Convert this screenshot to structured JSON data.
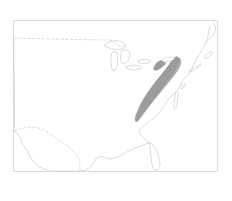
{
  "figure": {
    "kind": "distribution-range-map",
    "title": "",
    "caption": "",
    "region": "Eastern and central United States",
    "projection_note": "",
    "canvas": {
      "width": 232,
      "height": 201
    },
    "frame": {
      "x": 13.5,
      "y": 20.5,
      "width": 204,
      "height": 151,
      "stroke_color": "#d8d8d8",
      "visible": true
    }
  },
  "colors": {
    "background": "#ffffff",
    "frame_stroke": "#d8d8d8",
    "coastline_stroke": "#c9c9c9",
    "lake_stroke": "#c4c4c4",
    "political_border_stroke": "#cccccc",
    "range_fill": "#9c9c9c",
    "range_stroke": "#8f8f8f",
    "range_hole_fill": "#ffffff"
  },
  "legend": {
    "visible": false,
    "entries": []
  },
  "labels": {
    "visible": false,
    "items": []
  },
  "axes": {
    "visible": false,
    "tick_labels": []
  },
  "layers": [
    {
      "id": "national-outline",
      "name": "United States coastline and national outline",
      "style": "solid-thin-gray",
      "interactable": false
    },
    {
      "id": "great-lakes",
      "name": "Great Lakes outlines",
      "style": "solid-thin-gray",
      "interactable": false
    },
    {
      "id": "northern-border",
      "name": "United States - Canada border (49th parallel)",
      "style": "dashed-gray",
      "interactable": false
    },
    {
      "id": "southern-border",
      "name": "United States - Mexico border (Rio Grande)",
      "style": "dashed-gray",
      "interactable": false
    },
    {
      "id": "range-polygon",
      "name": "Shaded distribution range over the Appalachian region",
      "style": "filled-gray",
      "interactable": false
    }
  ],
  "geometry": {
    "frame_rect": "M13.5,20.5 L217.5,20.5 L217.5,171.5 L13.5,171.5 Z",
    "west_and_gulf_coast": "M13.8,38.2 L14.0,60.0 L14.2,88.0 L14.4,112.0 L14.6,131.5 L18.0,134.0 L20.5,138.0 L22.0,143.0 L25.0,147.5 L27.5,151.0 L29.5,156.0 L32.0,160.0 L35.5,163.5 L39.0,166.5 L43.0,168.5 L47.5,170.0 L52.0,171.0 L60.0,171.2 L70.0,171.2 L80.0,171.0",
    "gulf_coast_east": "M80.0,171.0 L86.0,170.0 L90.5,167.0 L93.0,163.5 L95.0,160.0 L97.5,157.5 L100.5,156.5 L104.0,157.0 L107.5,158.5 L111.0,159.0 L115.0,158.0 L119.5,156.0 L124.0,153.5 L129.0,151.0 L134.0,148.5 L139.0,146.5 L143.5,145.0 L147.0,143.5 L150.0,143.0",
    "florida": "M150.0,143.0 L152.5,144.5 L155.0,147.5 L157.0,151.5 L158.5,156.0 L159.5,160.5 L160.0,164.5 L159.5,167.5 L158.0,169.5 L156.0,170.0 L154.0,169.0 L152.5,166.5 L151.5,162.5 L151.0,157.5 L150.5,152.0 L150.0,147.0 L149.5,143.5 L147.5,141.0 L145.0,139.0 L142.5,137.0 L140.5,134.0 L139.0,131.0",
    "atlantic_coast": "M139.0,131.0 L142.0,127.5 L146.0,124.0 L150.5,120.5 L155.0,117.0 L158.5,113.5 L161.5,109.5 L164.5,105.5 L167.0,101.5 L169.5,98.0 L172.5,95.0 L175.5,92.5 L178.0,89.5 L180.0,86.0 L181.5,82.5 L183.5,79.5 L186.0,77.0 L188.5,74.5 L190.5,71.5 L192.0,68.0 L193.5,64.5 L195.5,61.0 L197.5,57.5 L199.5,54.0 L201.5,50.5 L203.5,47.0 L205.5,43.5 L207.0,40.0 L208.0,36.5 L208.5,33.0 L209.0,29.5 L209.5,26.0",
    "chesapeake_bay": "M176.0,92.0 L175.0,96.0 L174.5,100.0 L174.0,104.0 L173.5,107.5 L174.5,109.5 L176.0,108.0 L177.0,104.5 L177.5,100.0 L178.0,96.0 L178.5,92.5",
    "delaware_bay": "M183.5,84.0 L182.0,86.5 L181.5,89.0 L183.0,88.5 L184.5,86.0 L185.5,83.5",
    "long_island": "M190.0,70.5 L194.5,67.5 L199.0,65.0 L201.0,64.0 L199.5,66.5 L196.0,69.0 L192.5,71.0 L190.0,72.0 Z",
    "cape_cod": "M205.0,55.5 L208.5,53.0 L211.0,51.5 L212.5,52.5 L211.5,55.0 L209.0,57.0 L206.5,58.5 L205.0,58.0 Z",
    "maine_coast": "M206.0,42.0 L209.5,39.0 L212.5,36.0 L214.5,32.5 L215.5,29.0 L215.0,25.5 L213.0,22.5",
    "northern_canada_line": "M13.8,38.2 L24.0,38.4 L34.0,38.6 L44.0,38.8 L54.0,39.0 L64.0,39.2 L74.0,39.4 L84.0,39.6 L94.0,39.8 L104.0,40.0 L110.0,40.1",
    "northern_border_east": "M110.0,40.1 L114.5,42.5 L118.5,45.0 L122.0,46.5 L125.0,45.5",
    "great_lakes_superior": "M104.5,45.0 L108.5,42.5 L113.0,41.0 L117.5,40.5 L121.5,41.5 L124.5,43.5 L126.0,46.0 L124.0,48.0 L120.5,49.0 L116.0,49.5 L111.5,49.0 L107.5,47.5 L104.5,46.0 Z",
    "great_lakes_michigan": "M112.0,52.5 L114.5,51.0 L116.5,52.0 L117.5,55.5 L117.8,60.0 L117.5,64.5 L116.5,68.5 L114.5,71.0 L112.5,70.5 L111.5,67.0 L111.0,62.5 L111.2,57.5 Z",
    "great_lakes_huron": "M122.0,50.5 L125.5,49.5 L128.5,50.5 L130.0,53.5 L129.5,57.0 L128.0,60.5 L125.5,63.0 L123.0,64.0 L121.0,62.5 L120.5,59.0 L120.8,55.0 Z",
    "great_lakes_erie": "M126.0,66.5 L130.5,65.5 L135.0,65.0 L139.0,65.5 L141.5,67.0 L140.0,69.0 L136.0,70.0 L131.5,70.0 L127.5,69.0 Z",
    "great_lakes_ontario": "M138.5,60.5 L143.0,59.5 L147.5,59.5 L150.5,60.5 L149.5,62.5 L146.0,63.5 L141.5,63.5 L138.5,62.5 Z",
    "mexico_border": "M14.6,131.5 L20.0,129.0 L26.0,127.5 L32.0,127.0 L38.0,128.0 L44.0,130.0 L49.0,133.0 L53.5,136.5 L58.0,139.5 L62.5,142.5 L67.0,145.5 L71.0,149.0 L74.5,152.5 L77.5,156.5 L79.5,161.0 L80.0,166.0 L80.0,171.0",
    "appalachian_range": "M176.5,56.5 L180.0,58.5 L181.0,62.0 L180.0,66.0 L177.5,70.5 L174.0,75.5 L170.0,80.5 L165.5,86.0 L161.0,91.5 L156.5,97.0 L152.0,102.5 L148.0,107.5 L144.5,112.0 L141.5,116.0 L139.0,119.5 L137.0,121.8 L135.5,121.5 L135.0,119.0 L136.0,115.0 L138.0,110.0 L140.5,104.5 L143.5,99.0 L147.0,93.5 L151.0,88.0 L155.0,82.5 L159.0,77.5 L163.0,72.5 L166.5,68.0 L169.5,64.0 L172.0,60.5 L174.5,57.5 Z",
    "appalachian_notch": "M165.5,57.5 L171.5,57.0 L175.0,58.0 L172.0,60.5 L167.5,62.0 L163.5,62.0 L162.0,60.5 Z",
    "appalachian_north_lobe": "M158.0,61.5 L163.0,60.0 L166.0,61.5 L165.0,64.5 L161.5,67.5 L157.5,70.0 L154.5,70.5 L153.5,68.5 L155.0,65.0 Z",
    "range_east_edge": "M180.5,60.0 L178.5,66.0 L175.0,72.0 L170.5,78.5 L165.5,85.0 L160.5,91.5 L155.5,98.0 L151.0,104.0 L147.0,109.5 L143.5,114.5 L140.5,118.5 L138.0,121.5"
  },
  "interaction": {
    "zoom_level": "",
    "coordinates": "",
    "controls_visible": false
  }
}
